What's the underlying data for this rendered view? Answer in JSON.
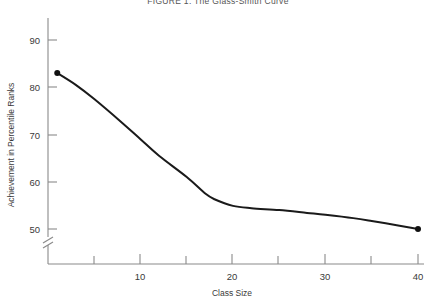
{
  "figure": {
    "title": "FIGURE 1.   The Glass-Smith Curve"
  },
  "chart_data": {
    "type": "line",
    "title": "FIGURE 1.   The Glass-Smith Curve",
    "xlabel": "Class Size",
    "ylabel": "Achievement in Percentile Ranks",
    "xlim": [
      0,
      40
    ],
    "ylim": [
      47,
      93
    ],
    "grid": false,
    "legend": "none",
    "y_axis_break": true,
    "y_axis_break_note": "break between origin and 50",
    "x_ticks_major": [
      10,
      20,
      30,
      40
    ],
    "x_tick_labels": [
      "10",
      "20",
      "30",
      "40"
    ],
    "x_ticks_minor": [
      5,
      15,
      25,
      35
    ],
    "y_ticks_major": [
      50,
      60,
      70,
      80,
      90
    ],
    "y_tick_labels": [
      "50",
      "60",
      "70",
      "80",
      "90"
    ],
    "series": [
      {
        "name": "Achievement vs Class Size",
        "marker_points": [
          {
            "x": 1,
            "y": 83
          },
          {
            "x": 40,
            "y": 50
          }
        ],
        "x": [
          1,
          3,
          5,
          8,
          10,
          12,
          15,
          17,
          18,
          20,
          22,
          25,
          28,
          30,
          33,
          35,
          38,
          40
        ],
        "values": [
          83,
          80.5,
          77.5,
          72.5,
          69,
          65.5,
          61,
          57.5,
          56.3,
          54.9,
          54.4,
          54,
          53.4,
          53,
          52.3,
          51.7,
          50.7,
          50
        ]
      }
    ]
  },
  "colors": {
    "curve": "#1a1a1a",
    "axis": "#8a8a8a",
    "text": "#3a3a3a",
    "background": "#ffffff"
  }
}
